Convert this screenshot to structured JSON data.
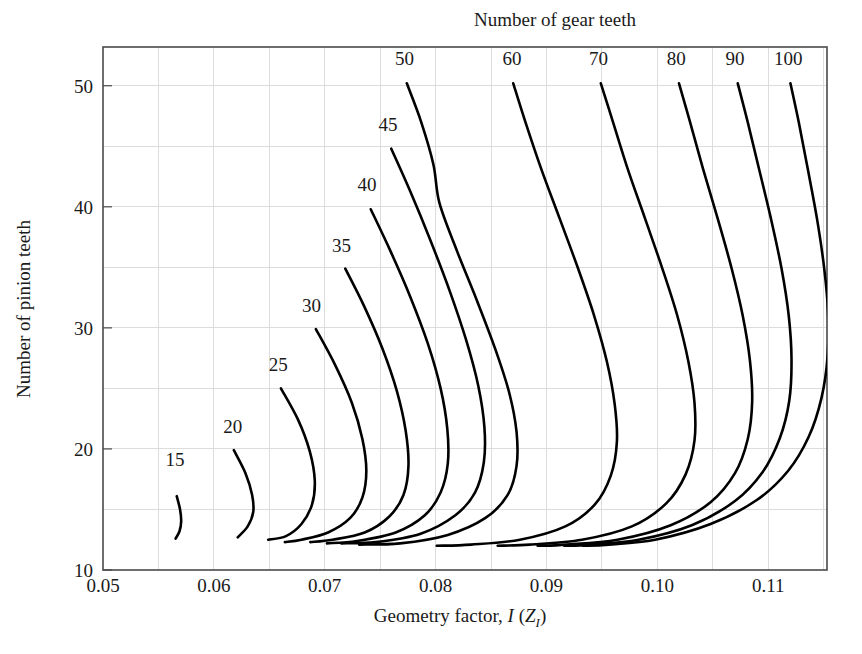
{
  "chart_data": {
    "type": "line",
    "title": "Number of gear teeth",
    "xlabel": "Geometry factor, I (Z_I)",
    "xlabel_parts": {
      "lead": "Geometry factor, ",
      "symbol": "I",
      "paren_open": " (",
      "symbol2": "Z",
      "subscript": "I",
      "paren_close": ")"
    },
    "ylabel": "Number of pinion teeth",
    "xlim": [
      0.05,
      0.1153
    ],
    "ylim": [
      10,
      53.2
    ],
    "grid": true,
    "legend_position": "inline-curve-labels",
    "x_major_ticks": [
      0.05,
      0.06,
      0.07,
      0.08,
      0.09,
      0.1,
      0.11
    ],
    "x_major_tick_labels": [
      "0.05",
      "0.06",
      "0.07",
      "0.08",
      "0.09",
      "0.10",
      "0.11"
    ],
    "x_minor_ticks": [
      0.055,
      0.065,
      0.075,
      0.085,
      0.095,
      0.105,
      0.115
    ],
    "y_major_ticks": [
      10,
      20,
      30,
      40,
      50
    ],
    "y_major_tick_labels": [
      "10",
      "20",
      "30",
      "40",
      "50"
    ],
    "y_minor_ticks": [
      15,
      25,
      35,
      45
    ],
    "series": [
      {
        "name": "15",
        "label": "15",
        "label_x": 0.0565,
        "label_y": 18.6,
        "points": [
          [
            0.05665,
            16.1
          ],
          [
            0.05695,
            15.0
          ],
          [
            0.05705,
            14.0
          ],
          [
            0.0569,
            13.2
          ],
          [
            0.05655,
            12.6
          ]
        ]
      },
      {
        "name": "20",
        "label": "20",
        "label_x": 0.0617,
        "label_y": 21.3,
        "points": [
          [
            0.0618,
            19.9
          ],
          [
            0.06285,
            18.0
          ],
          [
            0.06345,
            16.2
          ],
          [
            0.06355,
            14.8
          ],
          [
            0.06305,
            13.6
          ],
          [
            0.06215,
            12.7
          ]
        ]
      },
      {
        "name": "25",
        "label": "25",
        "label_x": 0.0658,
        "label_y": 26.4,
        "points": [
          [
            0.06605,
            25.0
          ],
          [
            0.0676,
            22.4
          ],
          [
            0.06865,
            19.8
          ],
          [
            0.0691,
            17.4
          ],
          [
            0.06885,
            15.4
          ],
          [
            0.0679,
            13.8
          ],
          [
            0.0665,
            12.8
          ],
          [
            0.0649,
            12.5
          ]
        ]
      },
      {
        "name": "30",
        "label": "30",
        "label_x": 0.0688,
        "label_y": 31.3,
        "points": [
          [
            0.0692,
            29.9
          ],
          [
            0.0709,
            27.0
          ],
          [
            0.07245,
            23.8
          ],
          [
            0.0734,
            20.8
          ],
          [
            0.07375,
            18.2
          ],
          [
            0.0734,
            16.0
          ],
          [
            0.0723,
            14.3
          ],
          [
            0.0703,
            13.1
          ],
          [
            0.0679,
            12.5
          ],
          [
            0.0664,
            12.3
          ]
        ]
      },
      {
        "name": "35",
        "label": "35",
        "label_x": 0.0715,
        "label_y": 36.3,
        "points": [
          [
            0.07185,
            34.9
          ],
          [
            0.07355,
            31.8
          ],
          [
            0.0752,
            28.3
          ],
          [
            0.0765,
            24.8
          ],
          [
            0.0773,
            21.5
          ],
          [
            0.07755,
            18.6
          ],
          [
            0.0771,
            16.2
          ],
          [
            0.0758,
            14.4
          ],
          [
            0.0736,
            13.1
          ],
          [
            0.0707,
            12.5
          ],
          [
            0.0687,
            12.3
          ]
        ]
      },
      {
        "name": "40",
        "label": "40",
        "label_x": 0.0738,
        "label_y": 41.3,
        "points": [
          [
            0.07415,
            39.8
          ],
          [
            0.0759,
            36.4
          ],
          [
            0.0777,
            32.6
          ],
          [
            0.0793,
            28.7
          ],
          [
            0.08045,
            25.0
          ],
          [
            0.08105,
            21.7
          ],
          [
            0.0811,
            18.8
          ],
          [
            0.08045,
            16.4
          ],
          [
            0.079,
            14.5
          ],
          [
            0.0764,
            13.1
          ],
          [
            0.0729,
            12.4
          ],
          [
            0.0702,
            12.2
          ]
        ]
      },
      {
        "name": "45",
        "label": "45",
        "label_x": 0.0757,
        "label_y": 46.3,
        "points": [
          [
            0.076,
            44.8
          ],
          [
            0.0777,
            41.3
          ],
          [
            0.0795,
            37.3
          ],
          [
            0.08125,
            33.1
          ],
          [
            0.08275,
            29.0
          ],
          [
            0.08385,
            25.2
          ],
          [
            0.0844,
            21.8
          ],
          [
            0.08435,
            18.9
          ],
          [
            0.08355,
            16.4
          ],
          [
            0.08175,
            14.5
          ],
          [
            0.07865,
            13.0
          ],
          [
            0.0746,
            12.3
          ],
          [
            0.0715,
            12.2
          ]
        ]
      },
      {
        "name": "50",
        "label": "50",
        "label_x": 0.0772,
        "label_y": 51.7,
        "points": [
          [
            0.0774,
            50.2
          ],
          [
            0.0787,
            47.0
          ],
          [
            0.0798,
            43.5
          ],
          [
            0.08035,
            40.3
          ],
          [
            0.08195,
            36.3
          ],
          [
            0.08375,
            32.2
          ],
          [
            0.0854,
            28.2
          ],
          [
            0.08665,
            24.6
          ],
          [
            0.0873,
            21.4
          ],
          [
            0.0873,
            18.6
          ],
          [
            0.0865,
            16.2
          ],
          [
            0.0845,
            14.3
          ],
          [
            0.0811,
            12.9
          ],
          [
            0.0768,
            12.2
          ],
          [
            0.0731,
            12.1
          ]
        ]
      },
      {
        "name": "60",
        "label": "60",
        "label_x": 0.0869,
        "label_y": 51.7,
        "points": [
          [
            0.087,
            50.2
          ],
          [
            0.0881,
            47.0
          ],
          [
            0.0895,
            43.2
          ],
          [
            0.0912,
            39.0
          ],
          [
            0.09285,
            34.9
          ],
          [
            0.0943,
            31.0
          ],
          [
            0.09545,
            27.2
          ],
          [
            0.09615,
            23.7
          ],
          [
            0.09635,
            20.6
          ],
          [
            0.0958,
            17.8
          ],
          [
            0.09435,
            15.4
          ],
          [
            0.0917,
            13.6
          ],
          [
            0.0876,
            12.5
          ],
          [
            0.0832,
            12.1
          ],
          [
            0.0801,
            12.0
          ]
        ]
      },
      {
        "name": "70",
        "label": "70",
        "label_x": 0.0947,
        "label_y": 51.7,
        "points": [
          [
            0.0949,
            50.2
          ],
          [
            0.096,
            47.0
          ],
          [
            0.0973,
            43.2
          ],
          [
            0.0989,
            39.0
          ],
          [
            0.10045,
            34.9
          ],
          [
            0.1018,
            31.0
          ],
          [
            0.1028,
            27.2
          ],
          [
            0.10335,
            23.8
          ],
          [
            0.10335,
            20.7
          ],
          [
            0.10255,
            17.9
          ],
          [
            0.1008,
            15.5
          ],
          [
            0.0977,
            13.6
          ],
          [
            0.0932,
            12.5
          ],
          [
            0.0885,
            12.1
          ],
          [
            0.0856,
            12.0
          ]
        ]
      },
      {
        "name": "80",
        "label": "80",
        "label_x": 0.1017,
        "label_y": 51.7,
        "points": [
          [
            0.10195,
            50.2
          ],
          [
            0.10295,
            47.0
          ],
          [
            0.1041,
            43.2
          ],
          [
            0.10545,
            39.0
          ],
          [
            0.1067,
            34.9
          ],
          [
            0.1077,
            31.0
          ],
          [
            0.10835,
            27.3
          ],
          [
            0.10855,
            23.9
          ],
          [
            0.10815,
            20.8
          ],
          [
            0.107,
            18.0
          ],
          [
            0.1048,
            15.6
          ],
          [
            0.1012,
            13.7
          ],
          [
            0.0964,
            12.5
          ],
          [
            0.0918,
            12.1
          ],
          [
            0.0892,
            12.0
          ]
        ]
      },
      {
        "name": "90",
        "label": "90",
        "label_x": 0.107,
        "label_y": 51.7,
        "points": [
          [
            0.10725,
            50.2
          ],
          [
            0.10815,
            47.0
          ],
          [
            0.10915,
            43.2
          ],
          [
            0.11025,
            39.0
          ],
          [
            0.1112,
            34.9
          ],
          [
            0.11185,
            31.0
          ],
          [
            0.1121,
            27.4
          ],
          [
            0.1119,
            24.0
          ],
          [
            0.11105,
            20.9
          ],
          [
            0.1095,
            18.1
          ],
          [
            0.107,
            15.7
          ],
          [
            0.1031,
            13.7
          ],
          [
            0.0983,
            12.5
          ],
          [
            0.094,
            12.1
          ],
          [
            0.0916,
            12.0
          ]
        ]
      },
      {
        "name": "100",
        "label": "100",
        "label_x": 0.1118,
        "label_y": 51.7,
        "points": [
          [
            0.112,
            50.2
          ],
          [
            0.11275,
            47.0
          ],
          [
            0.11355,
            43.2
          ],
          [
            0.1144,
            39.0
          ],
          [
            0.11505,
            34.9
          ],
          [
            0.1154,
            31.2
          ],
          [
            0.11535,
            27.6
          ],
          [
            0.1148,
            24.2
          ],
          [
            0.11365,
            21.0
          ],
          [
            0.1118,
            18.2
          ],
          [
            0.109,
            15.8
          ],
          [
            0.1048,
            13.8
          ],
          [
            0.0998,
            12.5
          ],
          [
            0.0956,
            12.1
          ],
          [
            0.0933,
            12.0
          ]
        ]
      }
    ]
  }
}
